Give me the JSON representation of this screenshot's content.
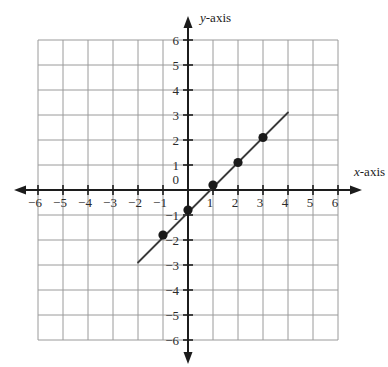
{
  "figure": {
    "kind": "coordinate-plane-line-graph",
    "background": "#ffffff",
    "grid_color": "#9a9a9a",
    "axis_color": "#1c1c1c",
    "line_color": "#3a3a3a",
    "point_color": "#1a1a1a",
    "label_color": "#2b2b2b"
  },
  "axes": {
    "x_label": "x-axis",
    "x_label_var": "x",
    "x_label_rest": "-axis",
    "y_label": "y-axis",
    "y_label_var": "y",
    "y_label_rest": "-axis",
    "origin_label": "0",
    "x_ticks": [
      -6,
      -5,
      -4,
      -3,
      -2,
      -1,
      1,
      2,
      3,
      4,
      5,
      6
    ],
    "y_ticks": [
      6,
      5,
      4,
      3,
      2,
      1,
      -1,
      -2,
      -3,
      -4,
      -5,
      -6
    ],
    "x_tick_labels": [
      "-6",
      "-5",
      "-4",
      "-3",
      "-2",
      "-1",
      "1",
      "2",
      "3",
      "4",
      "5",
      "6"
    ],
    "y_tick_labels": [
      "6",
      "5",
      "4",
      "3",
      "2",
      "1",
      "-1",
      "-2",
      "-3",
      "-4",
      "-5",
      "-6"
    ]
  },
  "chart_data": {
    "type": "line",
    "title": "",
    "xlabel": "x-axis",
    "ylabel": "y-axis",
    "xlim": [
      -6,
      6
    ],
    "ylim": [
      -6,
      6
    ],
    "grid": true,
    "legend": "none",
    "series": [
      {
        "name": "plotted-line",
        "kind": "line-segment",
        "equation": "y = x - 0.8",
        "slope": 1,
        "intercept": -0.8,
        "segment_x": [
          -2.0,
          4.0
        ],
        "segment_y": [
          -2.9,
          3.1
        ]
      },
      {
        "name": "plotted-points",
        "kind": "scatter",
        "x": [
          -1,
          0,
          1,
          2,
          3
        ],
        "y": [
          -1.8,
          -0.8,
          0.2,
          1.1,
          2.1
        ],
        "points": [
          {
            "x": -1,
            "y": -1.8
          },
          {
            "x": 0,
            "y": -0.8
          },
          {
            "x": 1,
            "y": 0.2
          },
          {
            "x": 2,
            "y": 1.1
          },
          {
            "x": 3,
            "y": 2.1
          }
        ]
      }
    ]
  }
}
